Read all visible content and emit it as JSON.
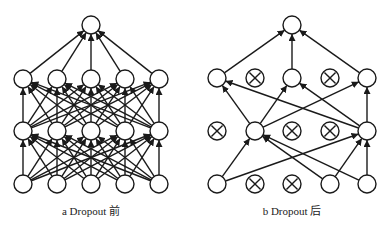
{
  "colors": {
    "stroke": "#1a1a1a",
    "node_fill": "#ffffff",
    "caption": "#222222"
  },
  "node_radius": 9,
  "panels": [
    {
      "id": "a",
      "caption": "a  Dropout 前",
      "caption_x": 91,
      "layers": [
        {
          "y": 25,
          "nodes": [
            {
              "x": 91,
              "dropped": false
            }
          ]
        },
        {
          "y": 79,
          "nodes": [
            {
              "x": 23,
              "dropped": false
            },
            {
              "x": 57,
              "dropped": false
            },
            {
              "x": 91,
              "dropped": false
            },
            {
              "x": 125,
              "dropped": false
            },
            {
              "x": 159,
              "dropped": false
            }
          ]
        },
        {
          "y": 131,
          "nodes": [
            {
              "x": 23,
              "dropped": false
            },
            {
              "x": 57,
              "dropped": false
            },
            {
              "x": 91,
              "dropped": false
            },
            {
              "x": 125,
              "dropped": false
            },
            {
              "x": 159,
              "dropped": false
            }
          ]
        },
        {
          "y": 184,
          "nodes": [
            {
              "x": 23,
              "dropped": false
            },
            {
              "x": 57,
              "dropped": false
            },
            {
              "x": 91,
              "dropped": false
            },
            {
              "x": 125,
              "dropped": false
            },
            {
              "x": 159,
              "dropped": false
            }
          ]
        }
      ],
      "fully_connected": true,
      "edges": []
    },
    {
      "id": "b",
      "caption": "b  Dropout 后",
      "caption_x": 292,
      "layers": [
        {
          "y": 25,
          "nodes": [
            {
              "x": 292,
              "dropped": false
            }
          ]
        },
        {
          "y": 78,
          "nodes": [
            {
              "x": 217,
              "dropped": false
            },
            {
              "x": 255,
              "dropped": true
            },
            {
              "x": 292,
              "dropped": false
            },
            {
              "x": 330,
              "dropped": true
            },
            {
              "x": 367,
              "dropped": false
            }
          ]
        },
        {
          "y": 131,
          "nodes": [
            {
              "x": 217,
              "dropped": true
            },
            {
              "x": 255,
              "dropped": false
            },
            {
              "x": 292,
              "dropped": true
            },
            {
              "x": 330,
              "dropped": true
            },
            {
              "x": 367,
              "dropped": false
            }
          ]
        },
        {
          "y": 184,
          "nodes": [
            {
              "x": 217,
              "dropped": false
            },
            {
              "x": 255,
              "dropped": true
            },
            {
              "x": 292,
              "dropped": true
            },
            {
              "x": 330,
              "dropped": false
            },
            {
              "x": 367,
              "dropped": false
            }
          ]
        }
      ],
      "fully_connected": false,
      "edges": [
        {
          "from": [
            1,
            0
          ],
          "to": [
            0,
            0
          ]
        },
        {
          "from": [
            1,
            2
          ],
          "to": [
            0,
            0
          ]
        },
        {
          "from": [
            1,
            4
          ],
          "to": [
            0,
            0
          ]
        },
        {
          "from": [
            2,
            1
          ],
          "to": [
            1,
            0
          ]
        },
        {
          "from": [
            2,
            1
          ],
          "to": [
            1,
            2
          ]
        },
        {
          "from": [
            2,
            1
          ],
          "to": [
            1,
            4
          ]
        },
        {
          "from": [
            2,
            4
          ],
          "to": [
            1,
            0
          ]
        },
        {
          "from": [
            2,
            4
          ],
          "to": [
            1,
            2
          ]
        },
        {
          "from": [
            2,
            4
          ],
          "to": [
            1,
            4
          ]
        },
        {
          "from": [
            3,
            0
          ],
          "to": [
            2,
            1
          ]
        },
        {
          "from": [
            3,
            0
          ],
          "to": [
            2,
            4
          ]
        },
        {
          "from": [
            3,
            3
          ],
          "to": [
            2,
            1
          ]
        },
        {
          "from": [
            3,
            3
          ],
          "to": [
            2,
            4
          ]
        },
        {
          "from": [
            3,
            4
          ],
          "to": [
            2,
            1
          ]
        },
        {
          "from": [
            3,
            4
          ],
          "to": [
            2,
            4
          ]
        }
      ]
    }
  ]
}
